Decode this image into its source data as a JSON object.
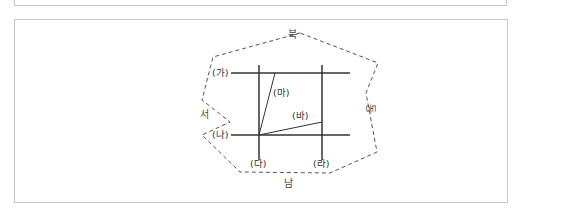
{
  "diagram": {
    "directions": {
      "north": "북",
      "south": "남",
      "east": "동",
      "west": "서"
    },
    "lines": {
      "ga": "(가)",
      "na": "(나)",
      "da": "(다)",
      "ra": "(라)",
      "ma": "(마)",
      "ba": "(바)"
    },
    "colors": {
      "line": "#333333",
      "dashed_boundary": "#555555",
      "border": "#c8c8c8"
    }
  }
}
